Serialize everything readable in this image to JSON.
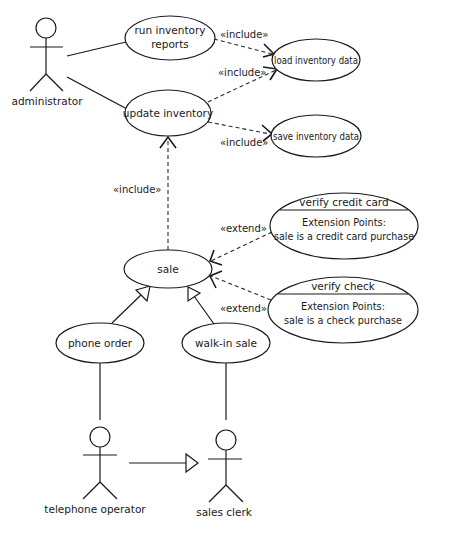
{
  "diagram": {
    "type": "UML use case diagram",
    "actors": [
      {
        "id": "administrator",
        "label": "administrator"
      },
      {
        "id": "telephone_operator",
        "label": "telephone operator"
      },
      {
        "id": "sales_clerk",
        "label": "sales clerk"
      }
    ],
    "use_cases": {
      "run_inventory_reports": {
        "line1": "run inventory",
        "line2": "reports"
      },
      "update_inventory": {
        "label": "update inventory"
      },
      "load_inventory_data": {
        "label": "load inventory data"
      },
      "save_inventory_data": {
        "label": "save inventory data"
      },
      "sale": {
        "label": "sale"
      },
      "verify_credit_card": {
        "label": "verify credit card",
        "ext_title": "Extension Points:",
        "ext_point": "sale is a credit card purchase"
      },
      "verify_check": {
        "label": "verify check",
        "ext_title": "Extension Points:",
        "ext_point": "sale is a check purchase"
      },
      "phone_order": {
        "label": "phone order"
      },
      "walk_in_sale": {
        "label": "walk-in sale"
      }
    },
    "stereotypes": {
      "include": "«include»",
      "extend": "«extend»"
    },
    "relationships": [
      {
        "type": "association",
        "from": "administrator",
        "to": "run inventory reports"
      },
      {
        "type": "association",
        "from": "administrator",
        "to": "update inventory"
      },
      {
        "type": "include",
        "from": "run inventory reports",
        "to": "load inventory data",
        "label": "«include»"
      },
      {
        "type": "include",
        "from": "update inventory",
        "to": "load inventory data",
        "label": "«include»"
      },
      {
        "type": "include",
        "from": "update inventory",
        "to": "save inventory data",
        "label": "«include»"
      },
      {
        "type": "include",
        "from": "sale",
        "to": "update inventory",
        "label": "«include»"
      },
      {
        "type": "extend",
        "from": "verify credit card",
        "to": "sale",
        "label": "«extend»"
      },
      {
        "type": "extend",
        "from": "verify check",
        "to": "sale",
        "label": "«extend»"
      },
      {
        "type": "generalization",
        "from": "phone order",
        "to": "sale"
      },
      {
        "type": "generalization",
        "from": "walk-in sale",
        "to": "sale"
      },
      {
        "type": "association",
        "from": "telephone operator",
        "to": "phone order"
      },
      {
        "type": "association",
        "from": "sales clerk",
        "to": "walk-in sale"
      },
      {
        "type": "generalization",
        "from": "telephone operator",
        "to": "sales clerk"
      }
    ]
  }
}
